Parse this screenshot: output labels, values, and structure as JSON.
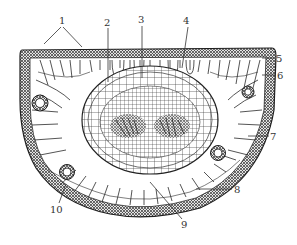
{
  "diagram": {
    "type": "botanical-cross-section",
    "colors": {
      "ink": "#2a2a2a",
      "background": "#ffffff",
      "label": "#333333"
    },
    "labels": [
      {
        "id": "1",
        "text": "1",
        "x": 62,
        "y": 24
      },
      {
        "id": "2",
        "text": "2",
        "x": 107,
        "y": 26
      },
      {
        "id": "3",
        "text": "3",
        "x": 141,
        "y": 23
      },
      {
        "id": "4",
        "text": "4",
        "x": 186,
        "y": 24
      },
      {
        "id": "5",
        "text": "5",
        "x": 276,
        "y": 61
      },
      {
        "id": "6",
        "text": "6",
        "x": 277,
        "y": 78
      },
      {
        "id": "7",
        "text": "7",
        "x": 271,
        "y": 141
      },
      {
        "id": "8",
        "text": "8",
        "x": 234,
        "y": 192
      },
      {
        "id": "9",
        "text": "9",
        "x": 184,
        "y": 227
      },
      {
        "id": "10",
        "text": "10",
        "x": 52,
        "y": 213
      }
    ]
  }
}
